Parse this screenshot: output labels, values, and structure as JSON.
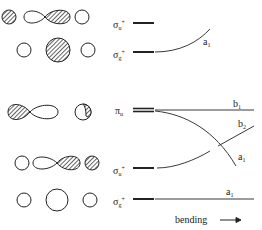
{
  "diagram": {
    "linear_levels": [
      {
        "symbol": "σ",
        "sub": "u",
        "sup": "+",
        "y": 23
      },
      {
        "symbol": "σ",
        "sub": "g",
        "sup": "+",
        "y": 52
      },
      {
        "symbol": "π",
        "sub": "u",
        "sup": "",
        "y": 110
      },
      {
        "symbol": "σ",
        "sub": "u",
        "sup": "+",
        "y": 168
      },
      {
        "symbol": "σ",
        "sub": "g",
        "sup": "+",
        "y": 199
      }
    ],
    "bent_labels": [
      {
        "symbol": "a",
        "sub": "1"
      },
      {
        "symbol": "b",
        "sub": "1"
      },
      {
        "symbol": "b",
        "sub": "2"
      },
      {
        "symbol": "a",
        "sub": "1"
      },
      {
        "symbol": "a",
        "sub": "1"
      }
    ],
    "axis_label": "bending",
    "colors": {
      "ink": "#222222",
      "background": "#ffffff"
    }
  }
}
